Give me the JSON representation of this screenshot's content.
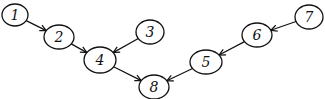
{
  "diagram": {
    "type": "directed-graph",
    "nodes": [
      {
        "id": "1",
        "label": "1",
        "x": 15,
        "y": 15,
        "rx": 13,
        "ry": 11
      },
      {
        "id": "2",
        "label": "2",
        "x": 59,
        "y": 37,
        "rx": 15,
        "ry": 12
      },
      {
        "id": "3",
        "label": "3",
        "x": 150,
        "y": 32,
        "rx": 14,
        "ry": 12
      },
      {
        "id": "4",
        "label": "4",
        "x": 100,
        "y": 60,
        "rx": 16,
        "ry": 13
      },
      {
        "id": "8",
        "label": "8",
        "x": 154,
        "y": 87,
        "rx": 15,
        "ry": 12
      },
      {
        "id": "5",
        "label": "5",
        "x": 206,
        "y": 62,
        "rx": 16,
        "ry": 12
      },
      {
        "id": "6",
        "label": "6",
        "x": 257,
        "y": 35,
        "rx": 15,
        "ry": 12
      },
      {
        "id": "7",
        "label": "7",
        "x": 309,
        "y": 17,
        "rx": 14,
        "ry": 12
      }
    ],
    "edges": [
      {
        "from": "1",
        "to": "2"
      },
      {
        "from": "2",
        "to": "4"
      },
      {
        "from": "3",
        "to": "4"
      },
      {
        "from": "4",
        "to": "8"
      },
      {
        "from": "7",
        "to": "6"
      },
      {
        "from": "6",
        "to": "5"
      },
      {
        "from": "5",
        "to": "8"
      }
    ]
  }
}
